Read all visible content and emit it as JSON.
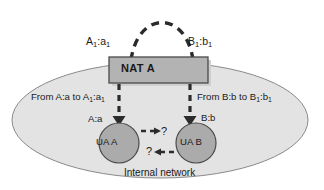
{
  "diagram": {
    "colors": {
      "background": "#ffffff",
      "cloud_fill": "#e3e3e3",
      "cloud_stroke": "#8a8a8a",
      "box_fill": "#b3b3b3",
      "box_stroke": "#4a4a4a",
      "node_fill": "#ababab",
      "node_stroke": "#4a4a4a",
      "arrow": "#2b2b2b",
      "text": "#1a1a1a",
      "shadow": "#cfcfcf"
    },
    "cloud": {
      "label": "Internal network"
    },
    "nat_box": {
      "label": "NAT A"
    },
    "external_labels": {
      "left": {
        "base": "A",
        "sub1": "1",
        "sep": ":",
        "port": "a",
        "sub2": "1"
      },
      "right": {
        "base": "B",
        "sub1": "1",
        "sep": ":",
        "port": "b",
        "sub2": "1"
      }
    },
    "translation_labels": {
      "left": {
        "prefix": "From A:a to A",
        "sub1": "1",
        "mid": ":a",
        "sub2": "1"
      },
      "right": {
        "prefix": "From B:b to B",
        "sub1": "1",
        "mid": ":b",
        "sub2": "1"
      }
    },
    "nodes": [
      {
        "id": "ua-a",
        "label": "UA A",
        "address": "A:a"
      },
      {
        "id": "ua-b",
        "label": "UA B",
        "address": "B:b"
      }
    ],
    "unknown_markers": {
      "top": "?",
      "bottom": "?"
    },
    "connectors": {
      "arc_style": "dashed",
      "vertical_style": "dashed",
      "internal_style": "dashed"
    }
  }
}
